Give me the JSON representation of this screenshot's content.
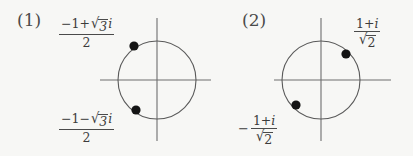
{
  "figure": {
    "background_color": "#f7f7f5",
    "ink_color": "#3c3c3c",
    "axis_color": "#6e6e6e",
    "circle_color": "#5a5a5a",
    "point_color": "#141414",
    "width": 413,
    "height": 156
  },
  "panels": [
    {
      "id": "panel-1",
      "number_label": "(1)",
      "diagram_type": "argand-unit-circle",
      "center": {
        "x": 157,
        "y": 80
      },
      "radius": 39,
      "axes": {
        "x_axis": {
          "x1": 100,
          "x2": 211,
          "y": 80
        },
        "y_axis": {
          "y1": 18,
          "y2": 141,
          "x": 157
        }
      },
      "points": [
        {
          "name": "root-upper",
          "x": 134,
          "y": 46,
          "angle_degrees": 120,
          "label_id": "label-1-top",
          "label_plain": "(-1 + sqrt(3) i) / 2",
          "label": {
            "lead_sign": "",
            "numerator_pre": "−1+",
            "numerator_radicand": "3",
            "numerator_post": "i",
            "denominator": "2",
            "denominator_radical": false
          }
        },
        {
          "name": "root-lower",
          "x": 136,
          "y": 110,
          "angle_degrees": 240,
          "label_id": "label-1-bottom",
          "label_plain": "(-1 - sqrt(3) i) / 2",
          "label": {
            "lead_sign": "",
            "numerator_pre": "−1−",
            "numerator_radicand": "3",
            "numerator_post": "i",
            "denominator": "2",
            "denominator_radical": false
          }
        }
      ]
    },
    {
      "id": "panel-2",
      "number_label": "(2)",
      "diagram_type": "argand-unit-circle",
      "center": {
        "x": 321,
        "y": 80
      },
      "radius": 39,
      "axes": {
        "x_axis": {
          "x1": 274,
          "x2": 391,
          "y": 80
        },
        "y_axis": {
          "y1": 18,
          "y2": 141,
          "x": 321
        }
      },
      "points": [
        {
          "name": "root-upper-right",
          "x": 346,
          "y": 54,
          "angle_degrees": 45,
          "label_id": "label-2-top",
          "label_plain": "(1 + i) / sqrt(2)",
          "label": {
            "lead_sign": "",
            "numerator_pre": "1+",
            "numerator_radicand": "",
            "numerator_post": "i",
            "denominator": "2",
            "denominator_radical": true
          }
        },
        {
          "name": "root-lower-left",
          "x": 296,
          "y": 105,
          "angle_degrees": 225,
          "label_id": "label-2-bottom",
          "label_plain": "-(1 + i) / sqrt(2)",
          "label": {
            "lead_sign": "−",
            "numerator_pre": "1+",
            "numerator_radicand": "",
            "numerator_post": "i",
            "denominator": "2",
            "denominator_radical": true
          }
        }
      ]
    }
  ],
  "glyphs": {
    "radical_sign": "√"
  }
}
